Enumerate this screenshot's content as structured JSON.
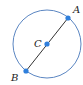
{
  "diagram": {
    "type": "circle-with-diameter",
    "colors": {
      "circle": "#5b86c2",
      "segment": "#333333",
      "point": "#2f7fdc",
      "label": "#222222"
    },
    "circle": {
      "cx": 47,
      "cy": 44,
      "r": 34
    },
    "segment": {
      "from": "B",
      "to": "A"
    },
    "points": [
      {
        "id": "A",
        "label": "A",
        "x": 68,
        "y": 18,
        "label_x": 73,
        "label_y": 13
      },
      {
        "id": "C",
        "label": "C",
        "x": 47,
        "y": 44,
        "label_x": 34,
        "label_y": 47
      },
      {
        "id": "B",
        "label": "B",
        "x": 26,
        "y": 71,
        "label_x": 11,
        "label_y": 81
      }
    ]
  }
}
